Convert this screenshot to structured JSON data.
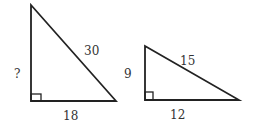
{
  "triangles": [
    {
      "name": "large-triangle",
      "labels": {
        "vertical_leg": "?",
        "hypotenuse": "30",
        "horizontal_leg": "18"
      }
    },
    {
      "name": "small-triangle",
      "labels": {
        "vertical_leg": "9",
        "hypotenuse": "15",
        "horizontal_leg": "12"
      }
    }
  ],
  "colors": {
    "stroke": "#222222",
    "text": "#333333",
    "background": "#ffffff"
  }
}
